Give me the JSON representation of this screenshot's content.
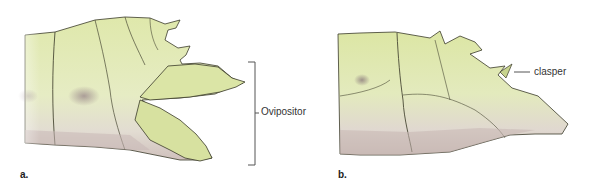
{
  "figure": {
    "panels": [
      {
        "letter": "a.",
        "subject": "female abdomen tip (lateral view)",
        "callout": "Ovipositor"
      },
      {
        "letter": "b.",
        "subject": "male abdomen tip (lateral view)",
        "callout": "clasper"
      }
    ],
    "colors": {
      "body_fill": "#d8e3a4",
      "body_light": "#e7edc2",
      "shadow_tint": "#b9a6a8",
      "outline": "#3a3a2a",
      "callout_line": "#555555",
      "label_text": "#333333"
    }
  }
}
